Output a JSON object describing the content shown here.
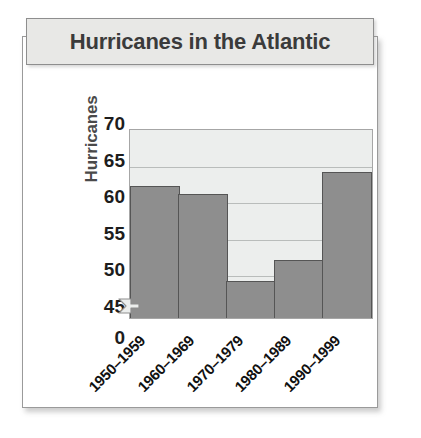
{
  "chart_data": {
    "type": "bar",
    "title": "Hurricanes in the Atlantic",
    "xlabel": "",
    "ylabel": "Hurricanes",
    "categories": [
      "1950–1959",
      "1960–1969",
      "1970–1979",
      "1980–1989",
      "1990–1999"
    ],
    "values": [
      62,
      61,
      49,
      52,
      64
    ],
    "ytick_labels": [
      "70",
      "65",
      "60",
      "55",
      "50",
      "45",
      "0"
    ],
    "ytick_values": [
      70,
      65,
      60,
      55,
      50,
      45,
      0
    ],
    "ylim": [
      44,
      70
    ],
    "axis_break": true,
    "grid": true,
    "legend": "none",
    "bar_color": "#8e8e8e",
    "bar_border_color": "#555555",
    "plot_background": "#eceeed",
    "gridline_color": "#b9bcbb",
    "title_color": "#3b3b3b",
    "axis_label_color": "#4a4a4a"
  }
}
